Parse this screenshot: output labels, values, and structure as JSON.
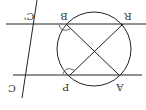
{
  "diagram": {
    "orientation": "rotated 180 degrees",
    "stroke_color": "#222222",
    "labels": {
      "R": "R",
      "B": "B",
      "C_prime": "C'",
      "C": "C",
      "P": "P",
      "A": "A"
    },
    "elements": {
      "circle": "circle through B, R, A, P",
      "parallel_lines": [
        "line through C', B, R",
        "line through C, P, A"
      ],
      "transversal": "line through C' and C",
      "chords": [
        "B-A",
        "R-P"
      ],
      "angle_marks": [
        "angle at B",
        "angle at P"
      ]
    }
  }
}
